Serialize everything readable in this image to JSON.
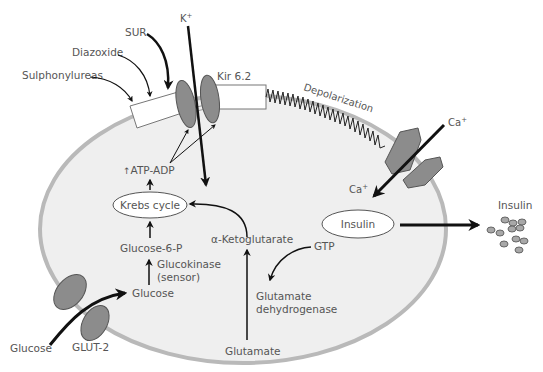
{
  "diagram": {
    "colors": {
      "cell_fill": "#efefef",
      "membrane": "#b9b9b9",
      "protein": "#8c8c8c",
      "arrow": "#111111",
      "text": "#555555"
    },
    "labels": {
      "sur": "SUR",
      "k_ion": "K",
      "k_sup": "+",
      "diazoxide": "Diazoxide",
      "sulphonylureas": "Sulphonylureas",
      "kir": "Kir 6.2",
      "depolarization": "Depolarization",
      "ca_out": "Ca",
      "ca_out_sup": "+",
      "ca_in": "Ca",
      "ca_in_sup": "+",
      "atp_adp": "ATP-ADP",
      "atp_up_glyph": "↑",
      "krebs": "Krebs cycle",
      "g6p": "Glucose-6-P",
      "glucokinase": "Glucokinase",
      "sensor": "(sensor)",
      "glucose_in": "Glucose",
      "glucose_out": "Glucose",
      "glut2": "GLUT-2",
      "aketo": "α-Ketoglutarate",
      "gtp": "GTP",
      "gdh_1": "Glutamate",
      "gdh_2": "dehydrogenase",
      "glutamate": "Glutamate",
      "insulin_in": "Insulin",
      "insulin_out": "Insulin"
    }
  }
}
